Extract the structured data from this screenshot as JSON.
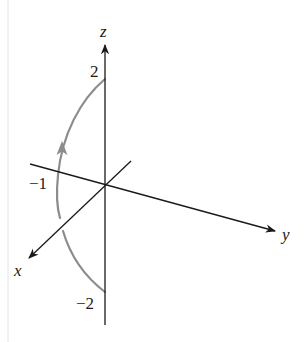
{
  "figure": {
    "type": "3d-coordinate-axes-with-parametric-curve",
    "axes": {
      "x": {
        "label": "x"
      },
      "y": {
        "label": "y"
      },
      "z": {
        "label": "z"
      }
    },
    "tick_labels": {
      "z_top": "2",
      "z_bottom": "−2",
      "y_negative": "−1"
    },
    "curve": {
      "description": "Arc in the plane y = -1 from (0,-1,-2) to (0,-1,2), oriented upward",
      "start_z": -2,
      "end_z": 2,
      "plane_y": -1,
      "direction": "upward",
      "color": "#8c8c8c"
    },
    "colors": {
      "axes": "#1a1a1a",
      "curve": "#8c8c8c",
      "background": "#ffffff"
    }
  }
}
